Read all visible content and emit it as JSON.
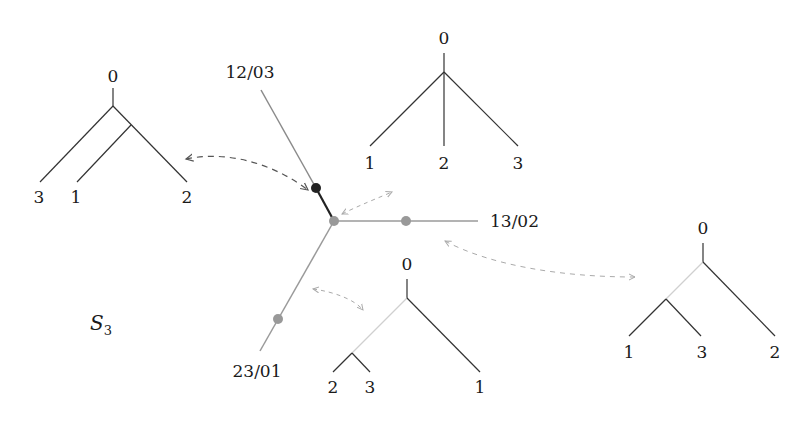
{
  "diagram": {
    "space_label": "S",
    "space_subscript": "3",
    "colors": {
      "tree_edge": "#333333",
      "faint_edge": "#c8c8c8",
      "spine_dark": "#333333",
      "spine_gray": "#999999",
      "node_black": "#222222",
      "node_gray": "#999999",
      "arrow_dark": "#555555",
      "arrow_light": "#aaaaaa"
    },
    "rays": [
      {
        "label": "12/03",
        "node": "black"
      },
      {
        "label": "13/02",
        "node": "gray"
      },
      {
        "label": "23/01",
        "node": "gray"
      }
    ],
    "trees": [
      {
        "id": "tree-left",
        "root": "0",
        "leaves": [
          "3",
          "1",
          "2"
        ],
        "topology": "((1,2),3)"
      },
      {
        "id": "tree-top",
        "root": "0",
        "leaves": [
          "1",
          "2",
          "3"
        ],
        "topology": "star"
      },
      {
        "id": "tree-bottom",
        "root": "0",
        "leaves": [
          "2",
          "3",
          "1"
        ],
        "topology": "((2,3),1)"
      },
      {
        "id": "tree-right",
        "root": "0",
        "leaves": [
          "1",
          "3",
          "2"
        ],
        "topology": "((1,3),2)"
      }
    ]
  }
}
